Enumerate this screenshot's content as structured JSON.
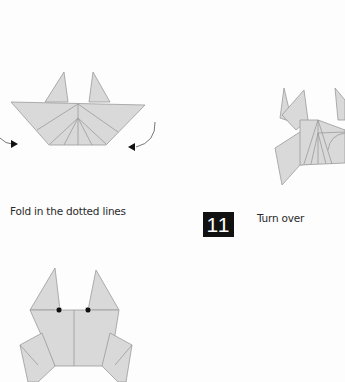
{
  "steps": [
    {
      "instruction": "Fold in the dotted lines"
    },
    {
      "number": "11",
      "instruction": "Turn over"
    }
  ],
  "colors": {
    "paper": "#d9d9d9",
    "crease": "#8c8c8c",
    "badge_bg": "#111111",
    "badge_text": "#ffffff",
    "background": "#fdfdfd"
  }
}
